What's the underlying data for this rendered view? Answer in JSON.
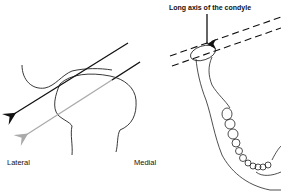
{
  "diagram": {
    "left_panel": {
      "labels": {
        "lateral": "Lateral",
        "medial": "Medial"
      },
      "arrows": [
        {
          "name": "black-projection-arrow",
          "color": "#111111"
        },
        {
          "name": "gray-projection-arrow",
          "color": "#aaaaaa"
        }
      ]
    },
    "right_panel": {
      "annotation": "Long axis of the condyle"
    }
  }
}
